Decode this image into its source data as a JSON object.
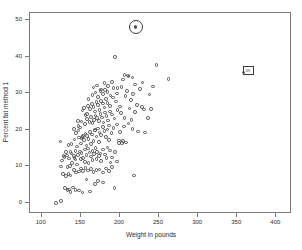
{
  "chart_data": {
    "type": "scatter",
    "title": "",
    "xlabel": "Weight in pounds",
    "ylabel": "Percent fat method 1",
    "xlim": [
      85,
      420
    ],
    "ylim": [
      -3,
      52
    ],
    "xticks": [
      100,
      150,
      200,
      250,
      300,
      350,
      400
    ],
    "xtick_labels": [
      "100",
      "150",
      "200",
      "250",
      "300",
      "350",
      "400"
    ],
    "yticks": [
      0,
      10,
      20,
      30,
      40,
      50
    ],
    "ytick_labels": [
      "0",
      "10",
      "20",
      "30",
      "40",
      "50"
    ],
    "grid": false,
    "legend": null,
    "marker": "open-circle",
    "marker_color": "#4d4d4d",
    "frame_color": "#7b7b7b",
    "points": [
      [
        118.5,
        0.0
      ],
      [
        125.0,
        0.6
      ],
      [
        130.0,
        4.1
      ],
      [
        133.0,
        3.5
      ],
      [
        135.0,
        3.7
      ],
      [
        137.0,
        3.0
      ],
      [
        140.0,
        4.2
      ],
      [
        143.0,
        3.5
      ],
      [
        148.0,
        3.4
      ],
      [
        152.0,
        2.9
      ],
      [
        157.0,
        6.4
      ],
      [
        162.0,
        3.2
      ],
      [
        168.0,
        5.2
      ],
      [
        172.0,
        6.1
      ],
      [
        178.0,
        5.6
      ],
      [
        193.0,
        4.1
      ],
      [
        127.0,
        7.9
      ],
      [
        131.0,
        7.4
      ],
      [
        134.0,
        8.0
      ],
      [
        137.0,
        7.5
      ],
      [
        141.0,
        9.1
      ],
      [
        144.0,
        8.4
      ],
      [
        148.0,
        8.6
      ],
      [
        150.0,
        9.4
      ],
      [
        153.0,
        8.8
      ],
      [
        156.0,
        9.6
      ],
      [
        159.0,
        8.9
      ],
      [
        163.0,
        9.3
      ],
      [
        166.0,
        8.5
      ],
      [
        170.0,
        9.0
      ],
      [
        174.0,
        9.2
      ],
      [
        178.0,
        8.3
      ],
      [
        182.0,
        9.5
      ],
      [
        186.0,
        8.7
      ],
      [
        190.0,
        9.8
      ],
      [
        196.0,
        11.4
      ],
      [
        218.0,
        7.5
      ],
      [
        126.0,
        11.6
      ],
      [
        129.0,
        12.6
      ],
      [
        132.0,
        13.0
      ],
      [
        135.0,
        12.2
      ],
      [
        138.0,
        13.5
      ],
      [
        141.0,
        12.8
      ],
      [
        143.0,
        11.9
      ],
      [
        146.0,
        13.2
      ],
      [
        149.0,
        14.1
      ],
      [
        151.0,
        13.7
      ],
      [
        153.0,
        12.4
      ],
      [
        155.0,
        14.6
      ],
      [
        157.0,
        13.1
      ],
      [
        159.0,
        14.9
      ],
      [
        161.0,
        13.8
      ],
      [
        163.0,
        12.7
      ],
      [
        165.0,
        14.3
      ],
      [
        167.0,
        13.4
      ],
      [
        169.0,
        15.0
      ],
      [
        171.0,
        14.0
      ],
      [
        173.0,
        12.9
      ],
      [
        175.0,
        13.6
      ],
      [
        178.0,
        14.7
      ],
      [
        181.0,
        13.3
      ],
      [
        184.0,
        15.2
      ],
      [
        187.0,
        14.4
      ],
      [
        190.0,
        12.5
      ],
      [
        194.0,
        13.9
      ],
      [
        199.0,
        16.4
      ],
      [
        203.0,
        16.5
      ],
      [
        208.0,
        16.6
      ],
      [
        124.0,
        16.8
      ],
      [
        134.0,
        15.9
      ],
      [
        138.0,
        16.1
      ],
      [
        142.0,
        17.4
      ],
      [
        145.0,
        15.5
      ],
      [
        148.0,
        17.9
      ],
      [
        150.0,
        16.3
      ],
      [
        152.0,
        18.1
      ],
      [
        154.0,
        17.2
      ],
      [
        156.0,
        19.0
      ],
      [
        158.0,
        18.4
      ],
      [
        160.0,
        17.6
      ],
      [
        162.0,
        19.5
      ],
      [
        164.0,
        18.8
      ],
      [
        166.0,
        17.0
      ],
      [
        168.0,
        19.9
      ],
      [
        170.0,
        18.2
      ],
      [
        172.0,
        20.4
      ],
      [
        174.0,
        19.3
      ],
      [
        176.0,
        18.6
      ],
      [
        178.0,
        20.8
      ],
      [
        180.0,
        19.7
      ],
      [
        182.0,
        18.0
      ],
      [
        184.0,
        20.1
      ],
      [
        186.0,
        21.2
      ],
      [
        189.0,
        19.1
      ],
      [
        192.0,
        20.6
      ],
      [
        196.0,
        21.5
      ],
      [
        200.0,
        19.4
      ],
      [
        205.0,
        20.9
      ],
      [
        211.0,
        21.8
      ],
      [
        216.0,
        20.2
      ],
      [
        223.0,
        19.6
      ],
      [
        232.0,
        19.3
      ],
      [
        147.0,
        21.0
      ],
      [
        151.0,
        22.3
      ],
      [
        155.0,
        21.6
      ],
      [
        158.0,
        23.0
      ],
      [
        161.0,
        22.1
      ],
      [
        163.0,
        23.6
      ],
      [
        165.0,
        21.9
      ],
      [
        167.0,
        22.8
      ],
      [
        169.0,
        24.0
      ],
      [
        171.0,
        23.2
      ],
      [
        173.0,
        22.5
      ],
      [
        175.0,
        24.4
      ],
      [
        177.0,
        23.4
      ],
      [
        179.0,
        22.0
      ],
      [
        181.0,
        24.8
      ],
      [
        183.0,
        23.8
      ],
      [
        185.0,
        22.6
      ],
      [
        187.0,
        25.1
      ],
      [
        190.0,
        24.2
      ],
      [
        193.0,
        23.1
      ],
      [
        197.0,
        25.5
      ],
      [
        201.0,
        24.6
      ],
      [
        206.0,
        23.3
      ],
      [
        212.0,
        25.9
      ],
      [
        219.0,
        24.9
      ],
      [
        228.0,
        26.2
      ],
      [
        236.0,
        23.2
      ],
      [
        141.0,
        20.3
      ],
      [
        144.0,
        19.2
      ],
      [
        146.0,
        22.4
      ],
      [
        149.0,
        20.7
      ],
      [
        152.0,
        25.3
      ],
      [
        154.0,
        26.0
      ],
      [
        156.0,
        24.1
      ],
      [
        159.0,
        26.5
      ],
      [
        162.0,
        25.7
      ],
      [
        164.0,
        27.1
      ],
      [
        166.0,
        26.3
      ],
      [
        168.0,
        25.0
      ],
      [
        170.0,
        27.6
      ],
      [
        172.0,
        26.8
      ],
      [
        174.0,
        25.4
      ],
      [
        176.0,
        28.0
      ],
      [
        178.0,
        27.2
      ],
      [
        180.0,
        26.1
      ],
      [
        182.0,
        28.5
      ],
      [
        184.0,
        27.4
      ],
      [
        187.0,
        26.6
      ],
      [
        191.0,
        28.9
      ],
      [
        195.0,
        27.8
      ],
      [
        200.0,
        26.4
      ],
      [
        207.0,
        29.3
      ],
      [
        214.0,
        28.2
      ],
      [
        222.0,
        26.9
      ],
      [
        231.0,
        25.6
      ],
      [
        240.0,
        25.8
      ],
      [
        160.0,
        28.4
      ],
      [
        165.0,
        29.6
      ],
      [
        169.0,
        30.2
      ],
      [
        172.0,
        29.0
      ],
      [
        175.0,
        30.7
      ],
      [
        178.0,
        29.8
      ],
      [
        181.0,
        31.0
      ],
      [
        184.0,
        30.4
      ],
      [
        188.0,
        29.4
      ],
      [
        192.0,
        31.4
      ],
      [
        196.0,
        30.0
      ],
      [
        202.0,
        31.8
      ],
      [
        209.0,
        30.6
      ],
      [
        217.0,
        29.9
      ],
      [
        226.0,
        31.2
      ],
      [
        238.0,
        29.7
      ],
      [
        166.0,
        31.6
      ],
      [
        171.0,
        32.2
      ],
      [
        176.0,
        31.1
      ],
      [
        180.0,
        32.8
      ],
      [
        185.0,
        32.0
      ],
      [
        190.0,
        33.2
      ],
      [
        197.0,
        31.5
      ],
      [
        204.0,
        33.8
      ],
      [
        211.0,
        34.6
      ],
      [
        219.0,
        32.4
      ],
      [
        229.0,
        33.0
      ],
      [
        242.0,
        31.9
      ],
      [
        262.0,
        33.9
      ],
      [
        210.0,
        34.9
      ],
      [
        216.0,
        34.4
      ],
      [
        206.0,
        35.0
      ],
      [
        247.0,
        37.8
      ],
      [
        194.0,
        40.0
      ],
      [
        158.0,
        24.3
      ],
      [
        153.0,
        18.3
      ],
      [
        150.0,
        12.1
      ],
      [
        143.0,
        14.2
      ],
      [
        139.0,
        11.0
      ],
      [
        136.0,
        10.2
      ],
      [
        133.0,
        9.9
      ],
      [
        145.0,
        10.6
      ],
      [
        155.0,
        11.3
      ],
      [
        160.0,
        10.9
      ],
      [
        165.0,
        11.8
      ],
      [
        170.0,
        12.0
      ],
      [
        176.0,
        11.5
      ],
      [
        183.0,
        12.3
      ],
      [
        188.0,
        11.1
      ],
      [
        199.0,
        17.1
      ],
      [
        204.0,
        16.9
      ],
      [
        215.0,
        22.7
      ],
      [
        173.0,
        16.7
      ],
      [
        186.0,
        17.3
      ],
      [
        168.0,
        20.0
      ],
      [
        163.0,
        16.2
      ],
      [
        157.0,
        15.7
      ],
      [
        151.0,
        17.8
      ],
      [
        147.0,
        19.8
      ],
      [
        142.0,
        12.4
      ],
      [
        137.0,
        14.0
      ],
      [
        131.0,
        13.9
      ],
      [
        128.0,
        12.9
      ],
      [
        125.0,
        10.0
      ]
    ],
    "annotations": [
      {
        "type": "circle-highlight",
        "label": "",
        "x": 220.0,
        "y": 48.2
      },
      {
        "type": "box-highlight",
        "label": "39",
        "x": 363.0,
        "y": 36.0
      }
    ]
  }
}
